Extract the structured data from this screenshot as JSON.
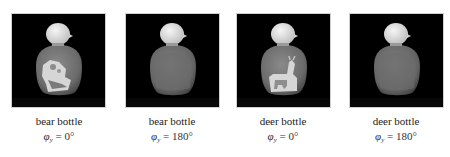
{
  "figure": {
    "panels": [
      {
        "object": "bear bottle",
        "symbol": "φ",
        "subscript": "y",
        "equals": "=",
        "angle": "0°",
        "view": "front",
        "label_type": "bear"
      },
      {
        "object": "bear bottle",
        "symbol": "φ",
        "subscript": "y",
        "equals": "=",
        "angle": "180°",
        "view": "back",
        "label_type": "none"
      },
      {
        "object": "deer bottle",
        "symbol": "φ",
        "subscript": "y",
        "equals": "=",
        "angle": "0°",
        "view": "front",
        "label_type": "deer"
      },
      {
        "object": "deer bottle",
        "symbol": "φ",
        "subscript": "y",
        "equals": "=",
        "angle": "180°",
        "view": "back",
        "label_type": "none"
      }
    ],
    "colors": {
      "background": "#000000",
      "bottle_body": "#6f6f6f",
      "bottle_cap": "#e6e6e6",
      "label": "#d9d9d9",
      "frame_border": "#cfcfcf"
    }
  }
}
